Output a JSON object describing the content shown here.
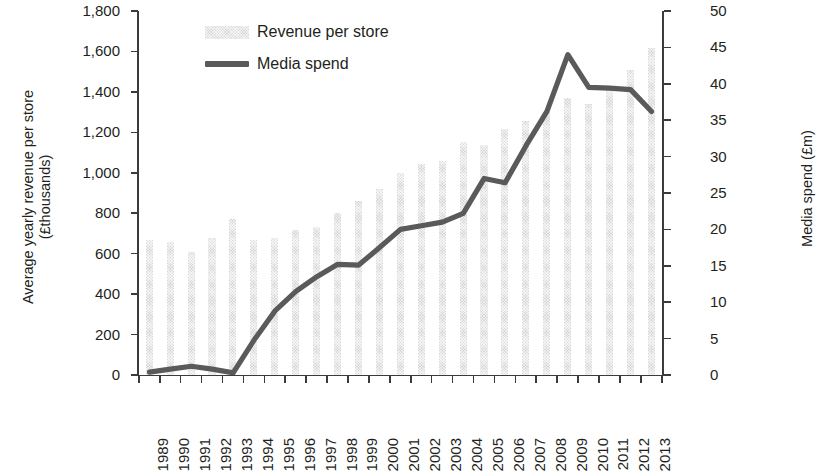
{
  "chart_data": {
    "type": "bar",
    "title": "",
    "subtitle": "",
    "xlabel": "",
    "ylabel": "Average yearly revenue per store (£thousands)",
    "y2label": "Media spend (£m)",
    "grid": false,
    "legend_position": "top-left",
    "categories": [
      "1989",
      "1990",
      "1991",
      "1992",
      "1993",
      "1994",
      "1995",
      "1996",
      "1997",
      "1998",
      "1999",
      "2000",
      "2001",
      "2002",
      "2003",
      "2004",
      "2005",
      "2006",
      "2007",
      "2008",
      "2009",
      "2010",
      "2011",
      "2012",
      "2013"
    ],
    "ylim": [
      0,
      1800
    ],
    "yticks": [
      0,
      200,
      400,
      600,
      800,
      1000,
      1200,
      1400,
      1600,
      1800
    ],
    "ytick_labels": [
      "0",
      "200",
      "400",
      "600",
      "800",
      "1,000",
      "1,200",
      "1,400",
      "1,600",
      "1,800"
    ],
    "y2lim": [
      0,
      50
    ],
    "y2ticks": [
      0,
      5,
      10,
      15,
      20,
      25,
      30,
      35,
      40,
      45,
      50
    ],
    "y2tick_labels": [
      "0",
      "5",
      "10",
      "15",
      "20",
      "25",
      "30",
      "35",
      "40",
      "45",
      "50"
    ],
    "series": [
      {
        "name": "Revenue per store",
        "type": "bar",
        "axis": "left",
        "color": "#d8d8d8",
        "values": [
          670,
          660,
          610,
          680,
          770,
          670,
          680,
          715,
          730,
          800,
          860,
          920,
          1000,
          1045,
          1060,
          1150,
          1135,
          1215,
          1255,
          1300,
          1370,
          1340,
          1410,
          1510,
          1615
        ]
      },
      {
        "name": "Media spend",
        "type": "line",
        "axis": "right",
        "color": "#5a5a5a",
        "values": [
          0.4,
          0.8,
          1.2,
          0.8,
          0.3,
          4.8,
          8.8,
          11.5,
          13.5,
          15.2,
          15.1,
          17.5,
          20.0,
          20.5,
          21.0,
          22.2,
          27.0,
          26.4,
          31.5,
          36.2,
          44.0,
          39.5,
          39.4,
          39.2,
          36.2
        ]
      }
    ]
  },
  "legend": {
    "items": [
      {
        "label": "Revenue per store",
        "marker": "bar-swatch"
      },
      {
        "label": "Media spend",
        "marker": "line-swatch"
      }
    ]
  },
  "axes": {
    "left_title_line1": "Average yearly revenue per store",
    "left_title_line2": "(£thousands)",
    "right_title": "Media spend (£m)"
  }
}
